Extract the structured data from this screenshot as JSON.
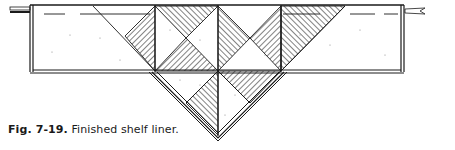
{
  "caption": {
    "label": "Fig. 7-19.",
    "text": " Finished shelf liner."
  },
  "diagram": {
    "subject": "shelf liner",
    "colors": {
      "line": "#1a1a1a",
      "background": "#ffffff",
      "hatch": "#1a1a1a"
    }
  }
}
